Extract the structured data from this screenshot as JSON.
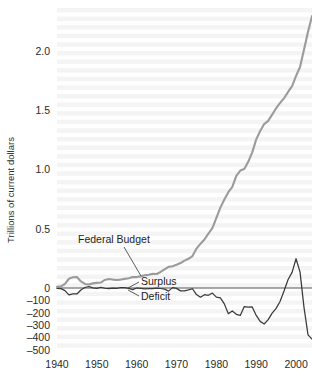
{
  "figure": {
    "background_color": "#ffffff",
    "plot_band_color": "#f2f2f2"
  },
  "chart_data": {
    "type": "line",
    "title": "",
    "xlabel": "",
    "ylabel": "Trillions of current dollars",
    "xlim": [
      1940,
      2004
    ],
    "x_ticks": [
      "1940",
      "1950",
      "1960",
      "1970",
      "1980",
      "1990",
      "2000"
    ],
    "x_tick_values": [
      1940,
      1950,
      1960,
      1970,
      1980,
      1990,
      2000
    ],
    "y_ticks_upper": [
      "0.5",
      "1.0",
      "1.5",
      "2.0"
    ],
    "y_tick_values_upper": [
      0.5,
      1.0,
      1.5,
      2.0
    ],
    "y_ticks_lower": [
      "0",
      "-100",
      "-200",
      "-300",
      "-400",
      "-500"
    ],
    "y_tick_values_lower": [
      0,
      -100,
      -200,
      -300,
      -400,
      -500
    ],
    "y_axis_note": "Dual scale: trillions of dollars above zero, billions of dollars below zero",
    "ylim_upper": [
      0,
      2.35
    ],
    "ylim_lower": [
      -500,
      0
    ],
    "grid": false,
    "legend_position": "inline-annotations",
    "annotations": [
      {
        "text": "Federal Budget",
        "series": "federal_budget",
        "x": 1953.5,
        "y_label": 0.36
      },
      {
        "text": "Surplus",
        "series": "surplus_deficit",
        "x": 1962.0,
        "y_label": 0.045
      },
      {
        "text": "Deficit",
        "series": "surplus_deficit",
        "x": 1962.0,
        "y_label": -95
      }
    ],
    "series": [
      {
        "name": "Federal Budget",
        "units": "trillions of current dollars",
        "color": "#9b9b9b",
        "x": [
          1940,
          1941,
          1942,
          1943,
          1944,
          1945,
          1946,
          1947,
          1948,
          1949,
          1950,
          1951,
          1952,
          1953,
          1954,
          1955,
          1956,
          1957,
          1958,
          1959,
          1960,
          1961,
          1962,
          1963,
          1964,
          1965,
          1966,
          1967,
          1968,
          1969,
          1970,
          1971,
          1972,
          1973,
          1974,
          1975,
          1976,
          1977,
          1978,
          1979,
          1980,
          1981,
          1982,
          1983,
          1984,
          1985,
          1986,
          1987,
          1988,
          1989,
          1990,
          1991,
          1992,
          1993,
          1994,
          1995,
          1996,
          1997,
          1998,
          1999,
          2000,
          2001,
          2002,
          2003,
          2004
        ],
        "values": [
          0.01,
          0.014,
          0.035,
          0.078,
          0.091,
          0.093,
          0.055,
          0.034,
          0.03,
          0.039,
          0.043,
          0.046,
          0.068,
          0.076,
          0.071,
          0.068,
          0.071,
          0.077,
          0.082,
          0.092,
          0.092,
          0.098,
          0.107,
          0.111,
          0.119,
          0.118,
          0.135,
          0.157,
          0.178,
          0.184,
          0.196,
          0.21,
          0.231,
          0.246,
          0.269,
          0.332,
          0.372,
          0.409,
          0.459,
          0.504,
          0.591,
          0.678,
          0.746,
          0.808,
          0.852,
          0.946,
          0.99,
          1.004,
          1.064,
          1.144,
          1.253,
          1.324,
          1.382,
          1.409,
          1.462,
          1.516,
          1.561,
          1.601,
          1.653,
          1.702,
          1.789,
          1.863,
          2.011,
          2.16,
          2.292
        ]
      },
      {
        "name": "Surplus / Deficit",
        "units": "billions of current dollars",
        "color": "#3a3a3a",
        "x": [
          1940,
          1941,
          1942,
          1943,
          1944,
          1945,
          1946,
          1947,
          1948,
          1949,
          1950,
          1951,
          1952,
          1953,
          1954,
          1955,
          1956,
          1957,
          1958,
          1959,
          1960,
          1961,
          1962,
          1963,
          1964,
          1965,
          1966,
          1967,
          1968,
          1969,
          1970,
          1971,
          1972,
          1973,
          1974,
          1975,
          1976,
          1977,
          1978,
          1979,
          1980,
          1981,
          1982,
          1983,
          1984,
          1985,
          1986,
          1987,
          1988,
          1989,
          1990,
          1991,
          1992,
          1993,
          1994,
          1995,
          1996,
          1997,
          1998,
          1999,
          2000,
          2001,
          2002,
          2003,
          2004
        ],
        "values": [
          -3,
          -5,
          -21,
          -55,
          -48,
          -48,
          -16,
          4,
          12,
          1,
          -3,
          6,
          -2,
          -6,
          -1,
          -3,
          4,
          3,
          -3,
          -13,
          0,
          -3,
          -7,
          -5,
          -6,
          -1,
          -4,
          -9,
          -25,
          3,
          -3,
          -23,
          -23,
          -15,
          -6,
          -53,
          -74,
          -54,
          -59,
          -41,
          -74,
          -79,
          -128,
          -208,
          -185,
          -212,
          -221,
          -150,
          -155,
          -153,
          -221,
          -269,
          -290,
          -255,
          -203,
          -164,
          -107,
          -22,
          69,
          126,
          236,
          128,
          -158,
          -378,
          -412
        ]
      }
    ]
  },
  "axis_titles": {
    "y": "Trillions of current dollars"
  }
}
